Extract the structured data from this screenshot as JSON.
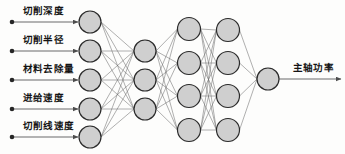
{
  "diagram": {
    "background_color": "#fdfdfc",
    "node_fill_color": "#cfcfcf",
    "node_stroke_color": "#2b2b2b",
    "edge_color": "#6e6e6e",
    "text_color": "#141414"
  },
  "inputs": [
    {
      "label": "切削深度",
      "dot_x": 12,
      "y": 22
    },
    {
      "label": "切削半径",
      "dot_x": 12,
      "y": 51
    },
    {
      "label": "材料去除量",
      "dot_x": 12,
      "y": 80
    },
    {
      "label": "进给速度",
      "dot_x": 12,
      "y": 109
    },
    {
      "label": "切削线速度",
      "dot_x": 12,
      "y": 137
    }
  ],
  "outputs": [
    {
      "label": "主轴功率",
      "y": 79
    }
  ],
  "layers": [
    {
      "name": "input-layer",
      "x": 90,
      "radius": 11,
      "node_count": 5,
      "node_y": [
        22,
        51,
        80,
        109,
        137
      ]
    },
    {
      "name": "hidden-layer-1",
      "x": 145,
      "radius": 11,
      "node_count": 3,
      "node_y": [
        51,
        80,
        109
      ]
    },
    {
      "name": "hidden-layer-2",
      "x": 189,
      "radius": 11.5,
      "node_count": 4,
      "node_y": [
        29,
        63,
        96,
        130
      ]
    },
    {
      "name": "hidden-layer-3",
      "x": 228,
      "radius": 11.5,
      "node_count": 4,
      "node_y": [
        30,
        63,
        96,
        130
      ]
    },
    {
      "name": "output-layer",
      "x": 268,
      "radius": 11,
      "node_count": 1,
      "node_y": [
        79
      ]
    }
  ],
  "connections": [
    {
      "from": "input-layer",
      "to": "hidden-layer-1",
      "fully_connected": true
    },
    {
      "from": "hidden-layer-1",
      "to": "hidden-layer-2",
      "fully_connected": true
    },
    {
      "from": "hidden-layer-2",
      "to": "hidden-layer-3",
      "fully_connected": true
    },
    {
      "from": "hidden-layer-3",
      "to": "output-layer",
      "fully_connected": true
    }
  ],
  "arrows": {
    "input_arrow_end_offset": 1,
    "output_arrow_end_x": 341
  }
}
